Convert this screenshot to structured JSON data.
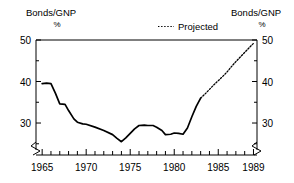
{
  "chart_data": {
    "type": "line",
    "title": "",
    "subtitle": "",
    "xlabel": "",
    "ylabel": "Bonds/GNP %",
    "left_axis_title_line1": "Bonds/GNP",
    "left_axis_title_line2": "%",
    "right_axis_title_line1": "Bonds/GNP",
    "right_axis_title_line2": "%",
    "xlim": [
      1964.3,
      1989.4
    ],
    "ylim": [
      23.5,
      50
    ],
    "grid": false,
    "axis_break_left": true,
    "axis_break_right": true,
    "y_ticks_major": [
      30,
      40,
      50
    ],
    "y_ticks_major_labels": [
      "30",
      "40",
      "50"
    ],
    "y_ticks_minor": [
      25,
      35,
      45
    ],
    "x_ticks_major": [
      1965,
      1970,
      1975,
      1980,
      1985,
      1989
    ],
    "x_ticks_major_labels": [
      "1965",
      "1970",
      "1975",
      "1980",
      "1985",
      "1989"
    ],
    "x_ticks_minor": [
      1966,
      1967,
      1968,
      1969,
      1971,
      1972,
      1973,
      1974,
      1976,
      1977,
      1978,
      1979,
      1981,
      1982,
      1983,
      1984,
      1986,
      1987,
      1988
    ],
    "legend_position": "top-center-right",
    "legend": [
      {
        "name": "Projected",
        "style": "dotted",
        "color": "#000000"
      }
    ],
    "series": [
      {
        "name": "Bonds/GNP actual",
        "style": "solid",
        "color": "#000000",
        "x": [
          1965,
          1965.5,
          1966,
          1966.5,
          1967,
          1967.6,
          1968,
          1968.6,
          1969,
          1969.6,
          1970,
          1971,
          1972,
          1973,
          1973.5,
          1974,
          1974.5,
          1975,
          1975.5,
          1976,
          1976.6,
          1977,
          1977.6,
          1978,
          1978.6,
          1979,
          1979.6,
          1980,
          1980.5,
          1981,
          1981.5,
          1982,
          1982.5,
          1983
        ],
        "y": [
          39.5,
          39.6,
          39.5,
          37.2,
          34.6,
          34.5,
          33.0,
          31.0,
          30.2,
          29.8,
          29.7,
          29.0,
          28.2,
          27.2,
          26.3,
          25.5,
          26.4,
          27.5,
          28.6,
          29.4,
          29.5,
          29.4,
          29.4,
          29.0,
          28.2,
          27.2,
          27.3,
          27.6,
          27.5,
          27.3,
          28.8,
          31.5,
          34.0,
          36.0
        ]
      },
      {
        "name": "Projected",
        "style": "dotted",
        "color": "#000000",
        "x": [
          1983,
          1983.5,
          1984,
          1984.5,
          1985,
          1985.5,
          1986,
          1986.5,
          1987,
          1987.5,
          1988,
          1988.5,
          1989
        ],
        "y": [
          36.0,
          37.0,
          38.1,
          39.2,
          40.2,
          41.2,
          42.3,
          43.6,
          44.8,
          45.9,
          47.0,
          48.1,
          49.2
        ]
      }
    ]
  }
}
